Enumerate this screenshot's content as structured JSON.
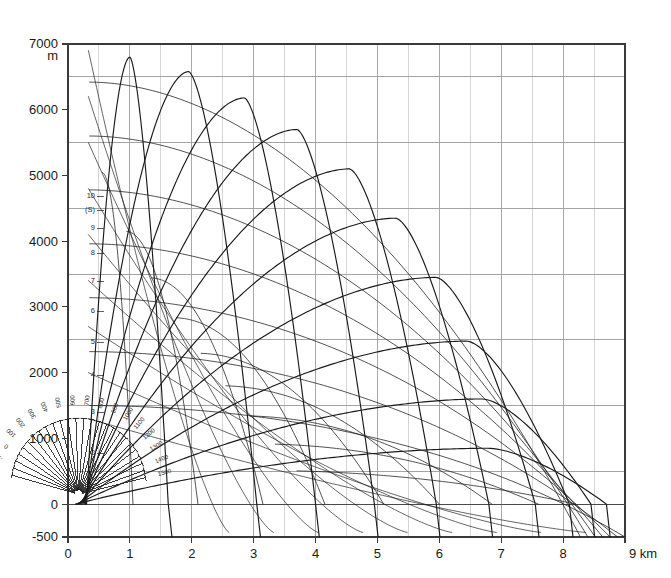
{
  "figure": {
    "background": "#ffffff",
    "grid_color": "#9a9a9a",
    "minor_grid_color": "#b9b9b9",
    "curve_color": "#1a1a1a",
    "axis_color": "#3a3a3a"
  },
  "axes": {
    "y_unit": "m",
    "x_unit_label": "9 km",
    "y_ticks": [
      {
        "value": 7000,
        "label": "7000"
      },
      {
        "value": 6000,
        "label": "6000"
      },
      {
        "value": 5000,
        "label": "5000"
      },
      {
        "value": 4000,
        "label": "4000"
      },
      {
        "value": 3000,
        "label": "3000"
      },
      {
        "value": 2000,
        "label": "2000"
      },
      {
        "value": 1000,
        "label": "1000"
      },
      {
        "value": 0,
        "label": "0"
      },
      {
        "value": -500,
        "label": "-500"
      }
    ],
    "x_ticks": [
      {
        "value": 0,
        "label": "0"
      },
      {
        "value": 1,
        "label": "1"
      },
      {
        "value": 2,
        "label": "2"
      },
      {
        "value": 3,
        "label": "3"
      },
      {
        "value": 4,
        "label": "4"
      },
      {
        "value": 5,
        "label": "5"
      },
      {
        "value": 6,
        "label": "6"
      },
      {
        "value": 7,
        "label": "7"
      },
      {
        "value": 8,
        "label": "8"
      },
      {
        "value": 9,
        "label": "9 km"
      }
    ]
  },
  "fan": {
    "elevation_labels": [
      "10",
      "(S)",
      "9",
      "8",
      "7",
      "6",
      "5",
      "4",
      "3",
      "2"
    ],
    "range_labels": [
      "1500",
      "1400",
      "1300",
      "1200",
      "1100",
      "1000",
      "900",
      "800",
      "700",
      "600",
      "500",
      "400",
      "300",
      "200",
      "100",
      "0",
      "-100",
      "-200"
    ]
  },
  "chart_data": {
    "type": "line",
    "title": "",
    "xlabel": "9 km",
    "ylabel": "m",
    "xlim": [
      0,
      9
    ],
    "ylim": [
      -500,
      7000
    ],
    "grid": true,
    "x_major_step": 1,
    "x_minor_step": 0.5,
    "y_major_step": 1000,
    "y_minor_step": 500,
    "legend": "none",
    "annotations": [
      "10",
      "(S)",
      "9",
      "8",
      "7",
      "6",
      "5",
      "4",
      "3",
      "2"
    ],
    "series": [
      {
        "name": "traj-1",
        "apex_x": 1.0,
        "apex_y": 6800,
        "launch_x": 0.3,
        "impact_x": 1.62
      },
      {
        "name": "traj-2",
        "apex_x": 1.95,
        "apex_y": 6580,
        "launch_x": 0.28,
        "impact_x": 3.05
      },
      {
        "name": "traj-3",
        "apex_x": 2.85,
        "apex_y": 6180,
        "launch_x": 0.26,
        "impact_x": 4.0
      },
      {
        "name": "traj-4",
        "apex_x": 3.7,
        "apex_y": 5700,
        "launch_x": 0.24,
        "impact_x": 4.95
      },
      {
        "name": "traj-5",
        "apex_x": 4.55,
        "apex_y": 5100,
        "launch_x": 0.22,
        "impact_x": 5.95
      },
      {
        "name": "traj-6",
        "apex_x": 5.3,
        "apex_y": 4350,
        "launch_x": 0.2,
        "impact_x": 6.8
      },
      {
        "name": "traj-7",
        "apex_x": 5.95,
        "apex_y": 3450,
        "launch_x": 0.18,
        "impact_x": 7.55
      },
      {
        "name": "traj-8",
        "apex_x": 6.45,
        "apex_y": 2480,
        "launch_x": 0.16,
        "impact_x": 8.1
      },
      {
        "name": "traj-9",
        "apex_x": 6.7,
        "apex_y": 1600,
        "launch_x": 0.14,
        "impact_x": 8.45
      },
      {
        "name": "traj-10",
        "apex_x": 6.8,
        "apex_y": 850,
        "launch_x": 0.12,
        "impact_x": 8.7
      }
    ],
    "isochrones": [
      {
        "name": "iso-1",
        "from_x": 0.55,
        "to_x": 1.05
      },
      {
        "name": "iso-2",
        "from_x": 0.95,
        "to_x": 2.1
      },
      {
        "name": "iso-3",
        "from_x": 1.35,
        "to_x": 3.15
      },
      {
        "name": "iso-4",
        "from_x": 1.75,
        "to_x": 4.15
      },
      {
        "name": "iso-5",
        "from_x": 2.15,
        "to_x": 5.1
      },
      {
        "name": "iso-6",
        "from_x": 2.55,
        "to_x": 6.0
      },
      {
        "name": "iso-7",
        "from_x": 2.95,
        "to_x": 6.85
      },
      {
        "name": "iso-8",
        "from_x": 3.35,
        "to_x": 7.6
      },
      {
        "name": "iso-9",
        "from_x": 3.7,
        "to_x": 8.2
      }
    ]
  }
}
